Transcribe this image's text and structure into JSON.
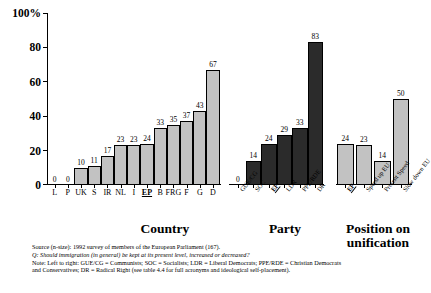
{
  "chart_data": {
    "type": "bar",
    "title": "",
    "ylabel": "",
    "xlabel": "",
    "ylim": [
      0,
      100
    ],
    "y_ticks": [
      "0",
      "20",
      "40",
      "60",
      "80",
      "100%"
    ],
    "y_tick_values": [
      0,
      20,
      40,
      60,
      80,
      100
    ],
    "grid": false,
    "legend": "none",
    "panels": [
      {
        "name": "country",
        "title": "Country",
        "bar_style": "light",
        "categories": [
          "L",
          "P",
          "UK",
          "S",
          "IR",
          "NL",
          "I",
          "EP",
          "B",
          "FRG",
          "F",
          "G",
          "D"
        ],
        "highlight": [
          "EP"
        ],
        "values": [
          0,
          0,
          10,
          11,
          17,
          23,
          23,
          24,
          33,
          35,
          37,
          43,
          67
        ]
      },
      {
        "name": "party",
        "title": "Party",
        "bar_style": "dark",
        "categories": [
          "GUE/CG",
          "SOC",
          "EP",
          "LDR",
          "PPE/RDE",
          "DR"
        ],
        "highlight": [
          "EP"
        ],
        "values": [
          0,
          14,
          24,
          29,
          33,
          83
        ]
      },
      {
        "name": "position-on-unification",
        "title": "Position on unification",
        "bar_style": "light",
        "categories": [
          "EP",
          "Speed up EU",
          "Present Speed",
          "Slow down EU"
        ],
        "highlight": [
          "EP"
        ],
        "values": [
          24,
          23,
          14,
          50
        ]
      }
    ]
  },
  "notes": {
    "source": "Source (n-size): 1992 survey of members of the European Parliament (167).",
    "question": "Q: Should immigration (in general) be kept at its present level, increased or decreased?",
    "note_line_1": "Note: Left to right: GUE/CG = Communists; SOC = Socialists; LDR = Liberal Democrats; PPE/RDE =  Christian Democrats",
    "note_line_2": "and Conservatives; DR = Radical Right (see table 4.4 for full acronyms and ideological self-placement)."
  },
  "colors": {
    "light_bar": "#c2c2c2",
    "dark_bar": "#2b2b2b",
    "axis": "#000000",
    "background": "#ffffff"
  }
}
